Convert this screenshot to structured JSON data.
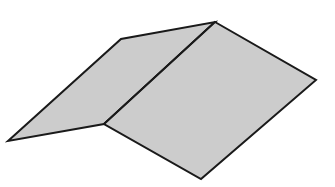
{
  "diagram": {
    "type": "folded-sheet",
    "fill_color": "#cccccc",
    "stroke_color": "#1a1a1a",
    "background": "#ffffff",
    "left_face": [
      [
        8,
        141
      ],
      [
        121,
        39
      ],
      [
        215,
        22
      ],
      [
        104,
        124
      ]
    ],
    "right_face": [
      [
        215,
        22
      ],
      [
        316,
        80
      ],
      [
        201,
        179
      ],
      [
        104,
        124
      ]
    ],
    "fold_line": [
      [
        215,
        22
      ],
      [
        104,
        124
      ]
    ]
  }
}
